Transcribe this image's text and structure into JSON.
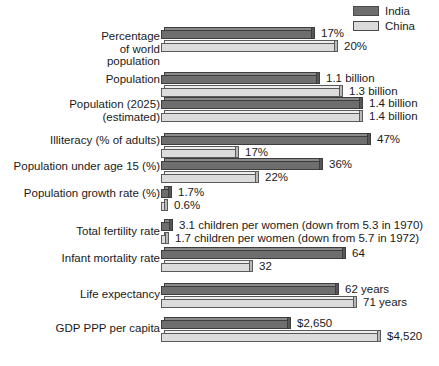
{
  "legend": {
    "items": [
      {
        "label": "India",
        "color": "#6e6e6e",
        "key": "india"
      },
      {
        "label": "China",
        "color": "#dcdcdc",
        "key": "china"
      }
    ]
  },
  "chart_data": {
    "type": "bar",
    "title": "",
    "subtitle": "",
    "xlabel": "",
    "ylabel": "",
    "orientation": "horizontal",
    "grid": false,
    "legend_position": "top-right",
    "series": [
      {
        "name": "India",
        "color": "#6e6e6e"
      },
      {
        "name": "China",
        "color": "#dcdcdc"
      }
    ],
    "categories": [
      "Percentage of world population",
      "Population",
      "Population (2025) (estimated)",
      "Illiteracy (% of adults)",
      "Population under age 15 (%)",
      "Population growth rate (%)",
      "Total fertility rate",
      "Infant mortality rate",
      "Life expectancy",
      "GDP PPP per capita"
    ],
    "rows": [
      {
        "category": "Percentage\nof world\npopulation",
        "india": {
          "value": 17,
          "label": "17%",
          "bar_px": 151
        },
        "china": {
          "value": 20,
          "label": "20%",
          "bar_px": 174
        }
      },
      {
        "category": "Population",
        "india": {
          "value": 1.1,
          "label": "1.1 billion",
          "bar_px": 156
        },
        "china": {
          "value": 1.3,
          "label": "1.3 billion",
          "bar_px": 179
        }
      },
      {
        "category": "Population (2025)\n(estimated)",
        "india": {
          "value": 1.4,
          "label": "1.4 billion",
          "bar_px": 199
        },
        "china": {
          "value": 1.4,
          "label": "1.4 billion",
          "bar_px": 199
        }
      },
      {
        "category": "Illiteracy (% of adults)",
        "india": {
          "value": 47,
          "label": "47%",
          "bar_px": 207
        },
        "china": {
          "value": 17,
          "label": "17%",
          "bar_px": 75
        }
      },
      {
        "category": "Population under age 15 (%)",
        "india": {
          "value": 36,
          "label": "36%",
          "bar_px": 159
        },
        "china": {
          "value": 22,
          "label": "22%",
          "bar_px": 95
        }
      },
      {
        "category": "Population growth rate (%)",
        "india": {
          "value": 1.7,
          "label": "1.7%",
          "bar_px": 8
        },
        "china": {
          "value": 0.6,
          "label": "0.6%",
          "bar_px": 4
        }
      },
      {
        "category": "Total fertility rate",
        "india": {
          "value": 3.1,
          "label": "3.1 children per women (down from 5.3 in 1970)",
          "bar_px": 9
        },
        "china": {
          "value": 1.7,
          "label": "1.7 children per women (down from 5.7 in 1972)",
          "bar_px": 5
        }
      },
      {
        "category": "Infant mortality rate",
        "india": {
          "value": 64,
          "label": "64",
          "bar_px": 182
        },
        "china": {
          "value": 32,
          "label": "32",
          "bar_px": 89
        }
      },
      {
        "category": "Life expectancy",
        "india": {
          "value": 62,
          "label": "62 years",
          "bar_px": 175
        },
        "china": {
          "value": 71,
          "label": "71 years",
          "bar_px": 193
        }
      },
      {
        "category": "GDP PPP per capita",
        "india": {
          "value": 2650,
          "label": "$2,650",
          "bar_px": 127
        },
        "china": {
          "value": 4520,
          "label": "$4,520",
          "bar_px": 217
        }
      }
    ]
  },
  "layout": {
    "group_tops": [
      27,
      72,
      97,
      133,
      158,
      186,
      219,
      247,
      283,
      317
    ],
    "label_tops": [
      30,
      73,
      98,
      134,
      160,
      187,
      225,
      252,
      288,
      322
    ]
  }
}
